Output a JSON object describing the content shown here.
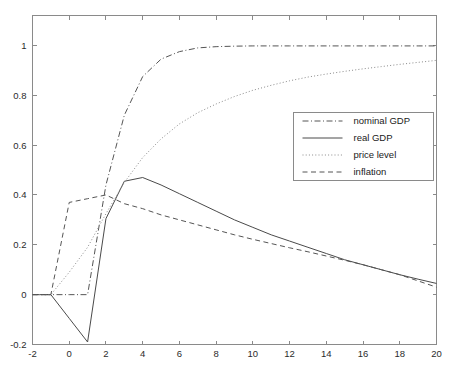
{
  "chart_data": {
    "type": "line",
    "title": "",
    "subtitle": "",
    "xlabel": "",
    "ylabel": "",
    "xlim": [
      -2,
      20
    ],
    "ylim": [
      -0.2,
      1.12
    ],
    "grid": false,
    "legend_position": "center-right",
    "xticks": [
      -2,
      0,
      2,
      4,
      6,
      8,
      10,
      12,
      14,
      16,
      18,
      20
    ],
    "xtick_labels": [
      "-2",
      "0",
      "2",
      "4",
      "6",
      "8",
      "10",
      "12",
      "14",
      "16",
      "18",
      "20"
    ],
    "yticks": [
      -0.2,
      0,
      0.2,
      0.4,
      0.6,
      0.8,
      1
    ],
    "ytick_labels": [
      "-0.2",
      "0",
      "0.2",
      "0.4",
      "0.6",
      "0.8",
      "1"
    ],
    "x": [
      -2,
      -1,
      0,
      1,
      2,
      3,
      4,
      5,
      6,
      7,
      8,
      9,
      10,
      11,
      12,
      13,
      14,
      15,
      16,
      17,
      18,
      19,
      20
    ],
    "series": [
      {
        "name": "nominal GDP",
        "style": "dashdot",
        "color": "#555555",
        "width": 1.0,
        "values": [
          0,
          0,
          0,
          0,
          0.44,
          0.72,
          0.875,
          0.945,
          0.975,
          0.99,
          0.995,
          0.997,
          0.998,
          0.998,
          0.998,
          0.998,
          0.998,
          0.998,
          0.998,
          0.998,
          0.998,
          0.998,
          0.998
        ]
      },
      {
        "name": "real GDP",
        "style": "solid",
        "color": "#4a4a4a",
        "width": 1.0,
        "values": [
          0,
          0,
          -0.095,
          -0.19,
          0.305,
          0.455,
          0.47,
          0.44,
          0.405,
          0.37,
          0.335,
          0.3,
          0.27,
          0.24,
          0.215,
          0.19,
          0.165,
          0.14,
          0.12,
          0.1,
          0.08,
          0.062,
          0.045
        ]
      },
      {
        "name": "price level",
        "style": "dotted",
        "color": "#8a8a8a",
        "width": 1.0,
        "values": [
          0,
          0,
          0.09,
          0.19,
          0.325,
          0.45,
          0.55,
          0.625,
          0.685,
          0.73,
          0.765,
          0.795,
          0.82,
          0.84,
          0.858,
          0.873,
          0.885,
          0.896,
          0.906,
          0.915,
          0.924,
          0.932,
          0.94
        ]
      },
      {
        "name": "inflation",
        "style": "dashed",
        "color": "#555555",
        "width": 1.0,
        "values": [
          0,
          0,
          0.37,
          0.385,
          0.4,
          0.365,
          0.345,
          0.32,
          0.3,
          0.28,
          0.26,
          0.24,
          0.222,
          0.205,
          0.188,
          0.172,
          0.155,
          0.138,
          0.12,
          0.1,
          0.08,
          0.055,
          0.03
        ]
      }
    ],
    "legend_entries": [
      {
        "label": "nominal GDP",
        "style": "dashdot"
      },
      {
        "label": "real GDP",
        "style": "solid"
      },
      {
        "label": "price level",
        "style": "dotted"
      },
      {
        "label": "inflation",
        "style": "dashed"
      }
    ]
  },
  "figure": {
    "background_color": "#ffffff",
    "axis_color": "#8a8a8a",
    "text_color": "#2b2b2b"
  }
}
